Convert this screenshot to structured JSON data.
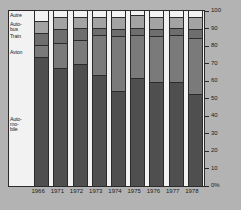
{
  "chart_data": {
    "type": "bar",
    "subtype": "stacked-100-percent",
    "title": "",
    "xlabel": "",
    "ylabel": "",
    "ylim": [
      0,
      100
    ],
    "yticks": [
      0,
      10,
      20,
      30,
      40,
      50,
      60,
      70,
      80,
      90,
      100
    ],
    "ytick_labels": [
      "0%",
      "10",
      "20",
      "30",
      "40",
      "50",
      "60",
      "70",
      "80",
      "90",
      "100"
    ],
    "grid": false,
    "legend_position": "left-inside",
    "categories": [
      "1966",
      "1971",
      "1972",
      "1973",
      "1974",
      "1975",
      "1976",
      "1977",
      "1978"
    ],
    "series": [
      {
        "name": "Automobile",
        "label": "Auto-\nmo-\nbile",
        "color": "#4f4f4f",
        "values": [
          73,
          67,
          69,
          63,
          54,
          61,
          59,
          59,
          52
        ]
      },
      {
        "name": "Avion",
        "label": "Avion",
        "color": "#7a7a7a",
        "values": [
          7,
          14,
          14,
          23,
          31,
          25,
          26,
          27,
          32
        ]
      },
      {
        "name": "Train",
        "label": "Train",
        "color": "#6e6e6e",
        "values": [
          7,
          8,
          7,
          4,
          4,
          4,
          4,
          4,
          5
        ]
      },
      {
        "name": "Autobus",
        "label": "Auto-\nbus",
        "color": "#a3a3a3",
        "values": [
          7,
          7,
          6,
          6,
          7,
          7,
          7,
          6,
          7
        ]
      },
      {
        "name": "Autre",
        "label": "Autre",
        "color": "#f2f2f2",
        "values": [
          6,
          4,
          4,
          4,
          4,
          3,
          4,
          4,
          4
        ]
      }
    ],
    "legend_label_positions_pct": [
      {
        "name": "Autre",
        "pct": 97
      },
      {
        "name": "Autobus",
        "pct": 92
      },
      {
        "name": "Train",
        "pct": 85
      },
      {
        "name": "Avion",
        "pct": 76
      },
      {
        "name": "Automobile",
        "pct": 38
      }
    ]
  },
  "style": {
    "background": "#b3b3b3",
    "plot_background": "#f2f2f2",
    "axis_color": "#2b2b2b",
    "text_color": "#1a1a1a"
  }
}
